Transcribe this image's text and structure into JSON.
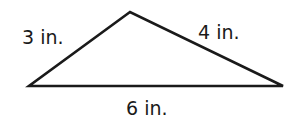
{
  "diagram": {
    "type": "triangle",
    "stroke_color": "#1a1a1a",
    "fill_color": "#ffffff",
    "vertices": {
      "apex": [
        130,
        12
      ],
      "left": [
        29,
        86
      ],
      "right": [
        283,
        86
      ]
    },
    "sides": [
      {
        "id": "left-side",
        "length": 3,
        "unit": "in.",
        "label": "3 in."
      },
      {
        "id": "right-side",
        "length": 4,
        "unit": "in.",
        "label": "4 in."
      },
      {
        "id": "base",
        "length": 6,
        "unit": "in.",
        "label": "6 in."
      }
    ]
  }
}
